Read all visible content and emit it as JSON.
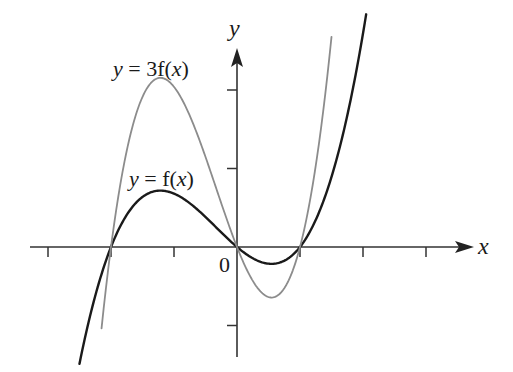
{
  "chart_data": {
    "type": "line",
    "title": "",
    "xlabel": "x",
    "ylabel": "y",
    "origin_label": "0",
    "x_ticks": [
      -3,
      -2,
      -1,
      0,
      1,
      2,
      3
    ],
    "y_ticks": [
      -1,
      1,
      2
    ],
    "xlim": [
      -3.2,
      3.8
    ],
    "ylim": [
      -1.45,
      2.9
    ],
    "grid": false,
    "legend": "inline-annotations",
    "series": [
      {
        "name": "y = f(x)",
        "label_parts": {
          "y": "y",
          "eq": " = f(",
          "x": "x",
          "close": ")"
        },
        "color": "#1a1a1a",
        "stroke_width": 2.4,
        "formula": "0.34*x*(x+2)*(x-1)",
        "coef": 1,
        "roots": [
          -2,
          0,
          1
        ],
        "x": [
          -2.5,
          -2.0,
          -1.5,
          -1.2,
          -1.0,
          -0.5,
          0.0,
          0.3,
          0.55,
          0.8,
          1.0,
          1.5,
          2.0,
          2.05
        ],
        "values": [
          -1.49,
          0.0,
          0.64,
          0.72,
          0.68,
          0.38,
          0.0,
          -0.16,
          -0.21,
          -0.16,
          0.0,
          0.89,
          2.72,
          2.95
        ]
      },
      {
        "name": "y = 3f(x)",
        "label_parts": {
          "y": "y",
          "eq": " = 3f(",
          "x": "x",
          "close": ")"
        },
        "color": "#8c8c8c",
        "stroke_width": 1.8,
        "formula": "3*0.34*x*(x+2)*(x-1)",
        "coef": 3,
        "roots": [
          -2,
          0,
          1
        ],
        "x": [
          -2.15,
          -2.0,
          -1.5,
          -1.2,
          -1.0,
          -0.5,
          0.0,
          0.3,
          0.55,
          0.8,
          1.0,
          1.3,
          1.5
        ],
        "values": [
          -1.45,
          0.0,
          1.91,
          2.15,
          2.04,
          1.15,
          0.0,
          -0.47,
          -0.64,
          -0.47,
          0.0,
          1.32,
          2.68
        ]
      }
    ],
    "annotations": [
      {
        "text": "y = 3f(x)",
        "attached_to": "y = 3f(x)",
        "position": "above left maximum"
      },
      {
        "text": "y = f(x)",
        "attached_to": "y = f(x)",
        "position": "above left maximum"
      }
    ]
  },
  "layout": {
    "origin_px": [
      237,
      247
    ],
    "px_per_x": 63,
    "px_per_y": 78.5
  }
}
